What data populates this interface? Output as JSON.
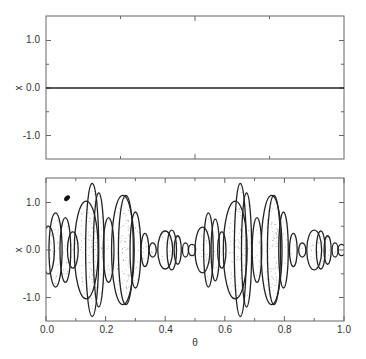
{
  "chart_data": [
    {
      "type": "line",
      "panel": "top",
      "title": "",
      "xlabel": "",
      "ylabel": "x",
      "xlim": [
        0,
        1
      ],
      "ylim": [
        -1.5,
        1.5
      ],
      "yticks": [
        "1.0",
        "0.0",
        "-1.0"
      ],
      "yticks_values": [
        1.0,
        0.0,
        -1.0
      ],
      "xticks_values": [
        0.25,
        0.5,
        0.75
      ],
      "xticks": [],
      "grid": false,
      "series": [
        {
          "name": "x(θ)",
          "x": [
            0,
            1
          ],
          "values": [
            0,
            0
          ]
        }
      ]
    },
    {
      "type": "scatter",
      "panel": "bottom",
      "title": "",
      "xlabel": "θ",
      "ylabel": "x",
      "xlim": [
        0,
        1
      ],
      "ylim": [
        -1.5,
        1.5
      ],
      "xticks": [
        "0.0",
        "0.2",
        "0.4",
        "0.6",
        "0.8",
        "1.0"
      ],
      "xticks_values": [
        0.0,
        0.2,
        0.4,
        0.6,
        0.8,
        1.0
      ],
      "xminor_ticks": [
        0.1,
        0.3,
        0.5,
        0.7,
        0.9
      ],
      "yticks": [
        "1.0",
        "0.0",
        "-1.0"
      ],
      "yticks_values": [
        1.0,
        0.0,
        -1.0
      ],
      "grid": false,
      "description": "Envelope of nested lens-shaped lobes (strange nonchaotic attractor-like bands), symmetric about x=0",
      "lobes": [
        {
          "theta": 0.008,
          "half_width": 0.02,
          "amp": 0.5
        },
        {
          "theta": 0.032,
          "half_width": 0.022,
          "amp": 0.78
        },
        {
          "theta": 0.065,
          "half_width": 0.018,
          "amp": 0.68
        },
        {
          "theta": 0.09,
          "half_width": 0.018,
          "amp": 0.38
        },
        {
          "theta": 0.135,
          "half_width": 0.04,
          "amp": 1.03
        },
        {
          "theta": 0.155,
          "half_width": 0.022,
          "amp": 1.4
        },
        {
          "theta": 0.177,
          "half_width": 0.018,
          "amp": 1.2
        },
        {
          "theta": 0.21,
          "half_width": 0.018,
          "amp": 0.68
        },
        {
          "theta": 0.258,
          "half_width": 0.038,
          "amp": 1.15
        },
        {
          "theta": 0.268,
          "half_width": 0.025,
          "amp": 1.15
        },
        {
          "theta": 0.3,
          "half_width": 0.018,
          "amp": 0.8
        },
        {
          "theta": 0.332,
          "half_width": 0.013,
          "amp": 0.35
        },
        {
          "theta": 0.358,
          "half_width": 0.012,
          "amp": 0.15
        },
        {
          "theta": 0.4,
          "half_width": 0.025,
          "amp": 0.4
        },
        {
          "theta": 0.422,
          "half_width": 0.016,
          "amp": 0.42
        },
        {
          "theta": 0.442,
          "half_width": 0.012,
          "amp": 0.3
        },
        {
          "theta": 0.468,
          "half_width": 0.01,
          "amp": 0.15
        },
        {
          "theta": 0.49,
          "half_width": 0.012,
          "amp": 0.12
        },
        {
          "theta": 0.525,
          "half_width": 0.025,
          "amp": 0.48
        },
        {
          "theta": 0.545,
          "half_width": 0.016,
          "amp": 0.78
        },
        {
          "theta": 0.568,
          "half_width": 0.014,
          "amp": 0.65
        },
        {
          "theta": 0.59,
          "half_width": 0.014,
          "amp": 0.38
        },
        {
          "theta": 0.635,
          "half_width": 0.04,
          "amp": 1.03
        },
        {
          "theta": 0.652,
          "half_width": 0.02,
          "amp": 1.4
        },
        {
          "theta": 0.673,
          "half_width": 0.017,
          "amp": 1.2
        },
        {
          "theta": 0.708,
          "half_width": 0.016,
          "amp": 0.68
        },
        {
          "theta": 0.757,
          "half_width": 0.035,
          "amp": 1.15
        },
        {
          "theta": 0.765,
          "half_width": 0.022,
          "amp": 1.15
        },
        {
          "theta": 0.797,
          "half_width": 0.016,
          "amp": 0.8
        },
        {
          "theta": 0.83,
          "half_width": 0.013,
          "amp": 0.35
        },
        {
          "theta": 0.86,
          "half_width": 0.012,
          "amp": 0.15
        },
        {
          "theta": 0.9,
          "half_width": 0.025,
          "amp": 0.42
        },
        {
          "theta": 0.922,
          "half_width": 0.015,
          "amp": 0.4
        },
        {
          "theta": 0.945,
          "half_width": 0.012,
          "amp": 0.3
        },
        {
          "theta": 0.97,
          "half_width": 0.01,
          "amp": 0.15
        },
        {
          "theta": 0.992,
          "half_width": 0.012,
          "amp": 0.12
        }
      ],
      "annotation_dot": {
        "theta": 0.07,
        "x": 1.09
      }
    }
  ],
  "labels": {
    "top_ylabel": "x",
    "bottom_ylabel": "x",
    "bottom_xlabel": "θ",
    "top_yticks": [
      "1.0",
      "0.0",
      "-1.0"
    ],
    "bottom_yticks": [
      "1.0",
      "0.0",
      "-1.0"
    ],
    "bottom_xticks": [
      "0.0",
      "0.2",
      "0.4",
      "0.6",
      "0.8",
      "1.0"
    ]
  },
  "colors": {
    "axis": "#666666",
    "line": "#222222",
    "stipple": "#888888",
    "text": "#333333"
  }
}
